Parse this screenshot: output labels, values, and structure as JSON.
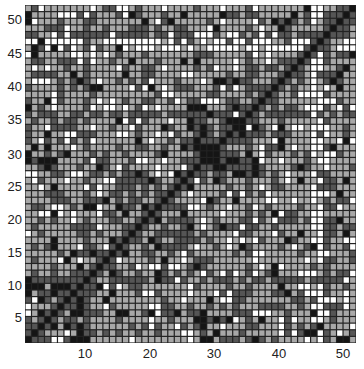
{
  "chart_data": {
    "type": "heatmap",
    "title": "",
    "xlabel": "",
    "ylabel": "",
    "rows": 51,
    "cols": 51,
    "xlim": [
      1,
      51
    ],
    "ylim": [
      1,
      51
    ],
    "x_ticks": [
      10,
      20,
      30,
      40,
      50
    ],
    "y_ticks": [
      5,
      10,
      15,
      20,
      25,
      30,
      35,
      40,
      45,
      50
    ],
    "palette": [
      "#ffffff",
      "#a8a8a8",
      "#555555",
      "#151515"
    ],
    "grid_line_color": "#222222",
    "diagonal_level": 3,
    "levels_description": "0=white, 1=light gray, 2=dark gray, 3=black",
    "structure_notes": {
      "dark_blocks": [
        {
          "rows": [
            15,
            25
          ],
          "cols": [
            15,
            25
          ]
        },
        {
          "rows": [
            1,
            10
          ],
          "cols": [
            1,
            10
          ]
        },
        {
          "rows": [
            26,
            36
          ],
          "cols": [
            26,
            36
          ]
        }
      ],
      "mostly_white_columns": [
        47
      ],
      "mostly_white_rows": [
        46,
        45
      ],
      "dark_rows": [
        47,
        35,
        10
      ]
    },
    "seed": 1234
  }
}
